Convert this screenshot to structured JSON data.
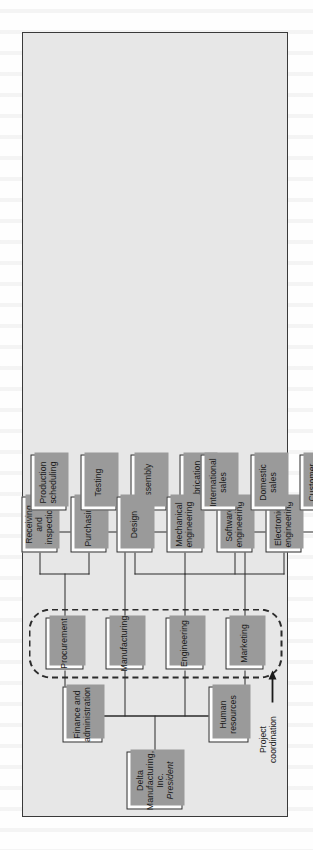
{
  "figure": {
    "type": "organization-chart",
    "orientation": "rotated-90-counterclockwise",
    "root": {
      "company": "Delta Manufacturing, Inc.",
      "title": "President"
    },
    "annotation": {
      "label_line1": "Project",
      "label_line2": "coordination",
      "arrow": "right-arrow-icon",
      "band": "dashed-rounded-rectangle"
    },
    "level2": [
      {
        "id": "finance",
        "label": "Finance and administration",
        "line1": "Finance and",
        "line2": "administration"
      },
      {
        "id": "human",
        "label": "Human resources",
        "line1": "Human",
        "line2": "resources"
      }
    ],
    "level2_functional": [
      {
        "id": "procurement",
        "label": "Procurement"
      },
      {
        "id": "manufacturing",
        "label": "Manufacturing"
      },
      {
        "id": "engineering",
        "label": "Engineering"
      },
      {
        "id": "marketing",
        "label": "Marketing"
      }
    ],
    "level3": {
      "procurement": [
        {
          "id": "receiving",
          "label": "Receiving and inspection",
          "line1": "Receiving and",
          "line2": "inspection"
        },
        {
          "id": "purchasing",
          "label": "Purchasing",
          "line1": "Purchasing",
          "line2": ""
        }
      ],
      "manufacturing": [
        {
          "id": "prodsched",
          "label": "Production scheduling",
          "line1": "Production",
          "line2": "scheduling"
        },
        {
          "id": "testing",
          "label": "Testing",
          "line1": "Testing",
          "line2": ""
        },
        {
          "id": "assembly",
          "label": "Assembly",
          "line1": "Assembly",
          "line2": ""
        },
        {
          "id": "fabrication",
          "label": "Fabrication",
          "line1": "Fabrication",
          "line2": ""
        }
      ],
      "engineering": [
        {
          "id": "design",
          "label": "Design",
          "line1": "Design",
          "line2": ""
        },
        {
          "id": "mechanical",
          "label": "Mechanical engineering",
          "line1": "Mechanical",
          "line2": "engineering"
        },
        {
          "id": "software",
          "label": "Software engineering",
          "line1": "Software",
          "line2": "engineering"
        },
        {
          "id": "electronics",
          "label": "Electronics engineering",
          "line1": "Electronics",
          "line2": "engineering"
        }
      ],
      "marketing": [
        {
          "id": "international",
          "label": "International sales",
          "line1": "International",
          "line2": "sales"
        },
        {
          "id": "domestic",
          "label": "Domestic sales",
          "line1": "Domestic",
          "line2": "sales"
        },
        {
          "id": "customer",
          "label": "Customer service",
          "line1": "Customer",
          "line2": "service"
        }
      ]
    },
    "colors": {
      "panel_background": "#e7e7e7",
      "box_fill": "#fdfdfd",
      "line": "#2b2b2b",
      "shadow": "#9a9a9a",
      "page": "#fefefe"
    }
  }
}
